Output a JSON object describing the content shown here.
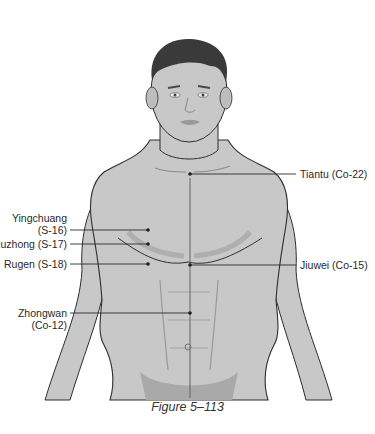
{
  "figure": {
    "caption": "Figure 5–113"
  },
  "points": [
    {
      "id": "tiantu",
      "name": "Tiantu",
      "code": "(Co-22)",
      "label": "Tiantu (Co-22)",
      "side": "right",
      "dot": [
        190,
        174
      ]
    },
    {
      "id": "yingchuang",
      "name": "Yingchuang",
      "code": "(S-16)",
      "side": "left",
      "dot": [
        148,
        230
      ]
    },
    {
      "id": "ruzhong",
      "name": "Ruzhong",
      "code": "(S-17)",
      "label": "Ruzhong (S-17)",
      "side": "left",
      "dot": [
        148,
        244
      ]
    },
    {
      "id": "rugen",
      "name": "Rugen",
      "code": "(S-18)",
      "label": "Rugen (S-18)",
      "side": "left",
      "dot": [
        148,
        264
      ]
    },
    {
      "id": "jiuwei",
      "name": "Jiuwei",
      "code": "(Co-15)",
      "label": "Jiuwei (Co-15)",
      "side": "right",
      "dot": [
        190,
        265
      ]
    },
    {
      "id": "zhongwan",
      "name": "Zhongwan",
      "code": "(Co-12)",
      "side": "left",
      "dot": [
        190,
        313
      ]
    }
  ],
  "colors": {
    "skin": "#c8c8c8",
    "skin_shadow": "#a9a9a9",
    "hair": "#3a3a3a",
    "outline": "#2e2e2e",
    "leader": "#2a2a2a"
  }
}
